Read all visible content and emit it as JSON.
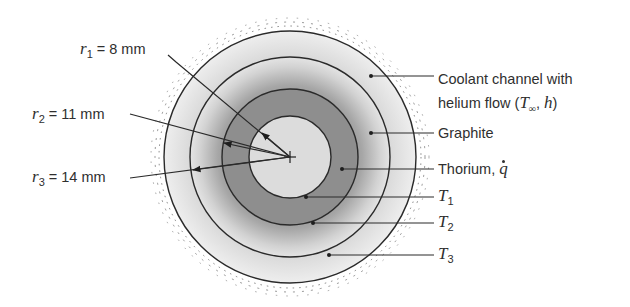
{
  "figure": {
    "type": "cross-section diagram",
    "center_px": [
      290,
      157
    ],
    "regions": [
      {
        "name": "Thorium core (inner)",
        "radius_px": 41,
        "fill": "#dcdcdc"
      },
      {
        "name": "Thorium",
        "radius_px": 68,
        "fill": "#8e8e8e"
      },
      {
        "name": "Graphite",
        "radius_px": 100,
        "fill": "gradient"
      },
      {
        "name": "Coolant channel",
        "radius_px": 126,
        "fill": "#e6e6e6"
      }
    ]
  },
  "left_labels": {
    "r1": {
      "symbol": "r",
      "sub": "1",
      "value": "= 8 mm"
    },
    "r2": {
      "symbol": "r",
      "sub": "2",
      "value": "= 11 mm"
    },
    "r3": {
      "symbol": "r",
      "sub": "3",
      "value": "= 14 mm"
    }
  },
  "right_labels": {
    "coolant_line1": "Coolant channel with",
    "coolant_line2_prefix": "helium flow (",
    "coolant_T": "T",
    "coolant_T_sub": "∞",
    "coolant_sep": ", ",
    "coolant_h": "h",
    "coolant_close": ")",
    "graphite": "Graphite",
    "thorium_prefix": "Thorium, ",
    "thorium_q": "q",
    "T1": {
      "symbol": "T",
      "sub": "1"
    },
    "T2": {
      "symbol": "T",
      "sub": "2"
    },
    "T3": {
      "symbol": "T",
      "sub": "3"
    }
  },
  "colors": {
    "line": "#2a2a2a",
    "thorium": "#8c8c8c",
    "inner": "#dadada",
    "graphite_dark": "#a8a8a8",
    "graphite_light": "#e8e8e8",
    "coolant": "#ebebeb"
  }
}
